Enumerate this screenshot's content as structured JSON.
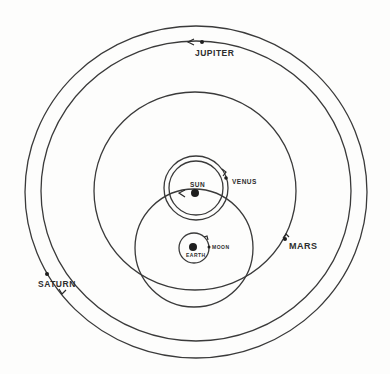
{
  "diagram": {
    "type": "Tychonic geocentric system",
    "colors": {
      "ink": "#2e2e2e",
      "paper": "#fdfdfc"
    },
    "labels": {
      "jupiter": "JUPITER",
      "sun": "SUN",
      "venus": "VENUS",
      "moon": "MOON",
      "earth": "EARTH",
      "mars": "MARS",
      "saturn": "SATURN"
    }
  }
}
